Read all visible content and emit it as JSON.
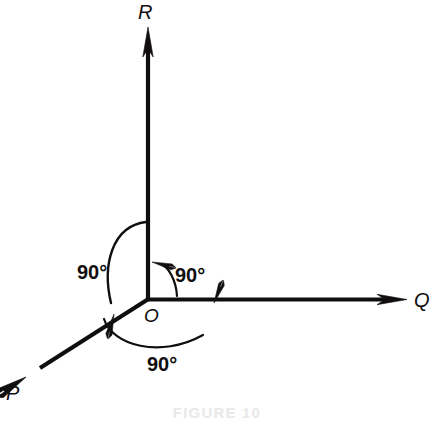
{
  "figure": {
    "caption": "FIGURE 10",
    "background_color": "#ffffff",
    "stroke_color": "#100e0e",
    "axes": [
      {
        "id": "P",
        "label": "P",
        "direction": "down-left",
        "arrow": "outward",
        "label_position": {
          "x": 13,
          "y": 398
        }
      },
      {
        "id": "Q",
        "label": "Q",
        "direction": "right",
        "arrow": "outward",
        "label_position": {
          "x": 414,
          "y": 307
        }
      },
      {
        "id": "R",
        "label": "R",
        "direction": "up",
        "arrow": "outward",
        "label_position": {
          "x": 138,
          "y": 19
        }
      }
    ],
    "origin": {
      "label": "O",
      "x": 148,
      "y": 299,
      "label_position": {
        "x": 152,
        "y": 321
      }
    },
    "angles": [
      {
        "id": "angle-R-P",
        "label": "90°",
        "value": 90,
        "unit": "degrees",
        "between": [
          "R",
          "P"
        ],
        "label_position": {
          "x": 78,
          "y": 279
        },
        "arc_direction": "R-to-P"
      },
      {
        "id": "angle-Q-R",
        "label": "90°",
        "value": 90,
        "unit": "degrees",
        "between": [
          "Q",
          "R"
        ],
        "label_position": {
          "x": 176,
          "y": 282
        },
        "arc_direction": "Q-to-R"
      },
      {
        "id": "angle-P-Q",
        "label": "90°",
        "value": 90,
        "unit": "degrees",
        "between": [
          "P",
          "Q"
        ],
        "label_position": {
          "x": 148,
          "y": 371
        },
        "arc_direction": "P-to-Q"
      }
    ]
  }
}
